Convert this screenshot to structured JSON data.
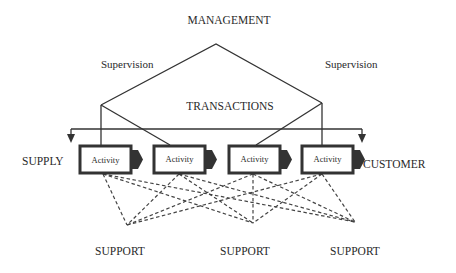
{
  "diagram": {
    "title": "MANAGEMENT",
    "supervision_left": "Supervision",
    "supervision_right": "Supervision",
    "transactions": "TRANSACTIONS",
    "supply": "SUPPLY",
    "customer": "CUSTOMER",
    "activities": [
      {
        "label": "Activity"
      },
      {
        "label": "Activity"
      },
      {
        "label": "Activity"
      },
      {
        "label": "Activity"
      }
    ],
    "supports": [
      {
        "label": "SUPPORT"
      },
      {
        "label": "SUPPORT"
      },
      {
        "label": "SUPPORT"
      }
    ],
    "colors": {
      "line": "#333333",
      "text": "#2a2a2a",
      "background": "#ffffff"
    }
  }
}
